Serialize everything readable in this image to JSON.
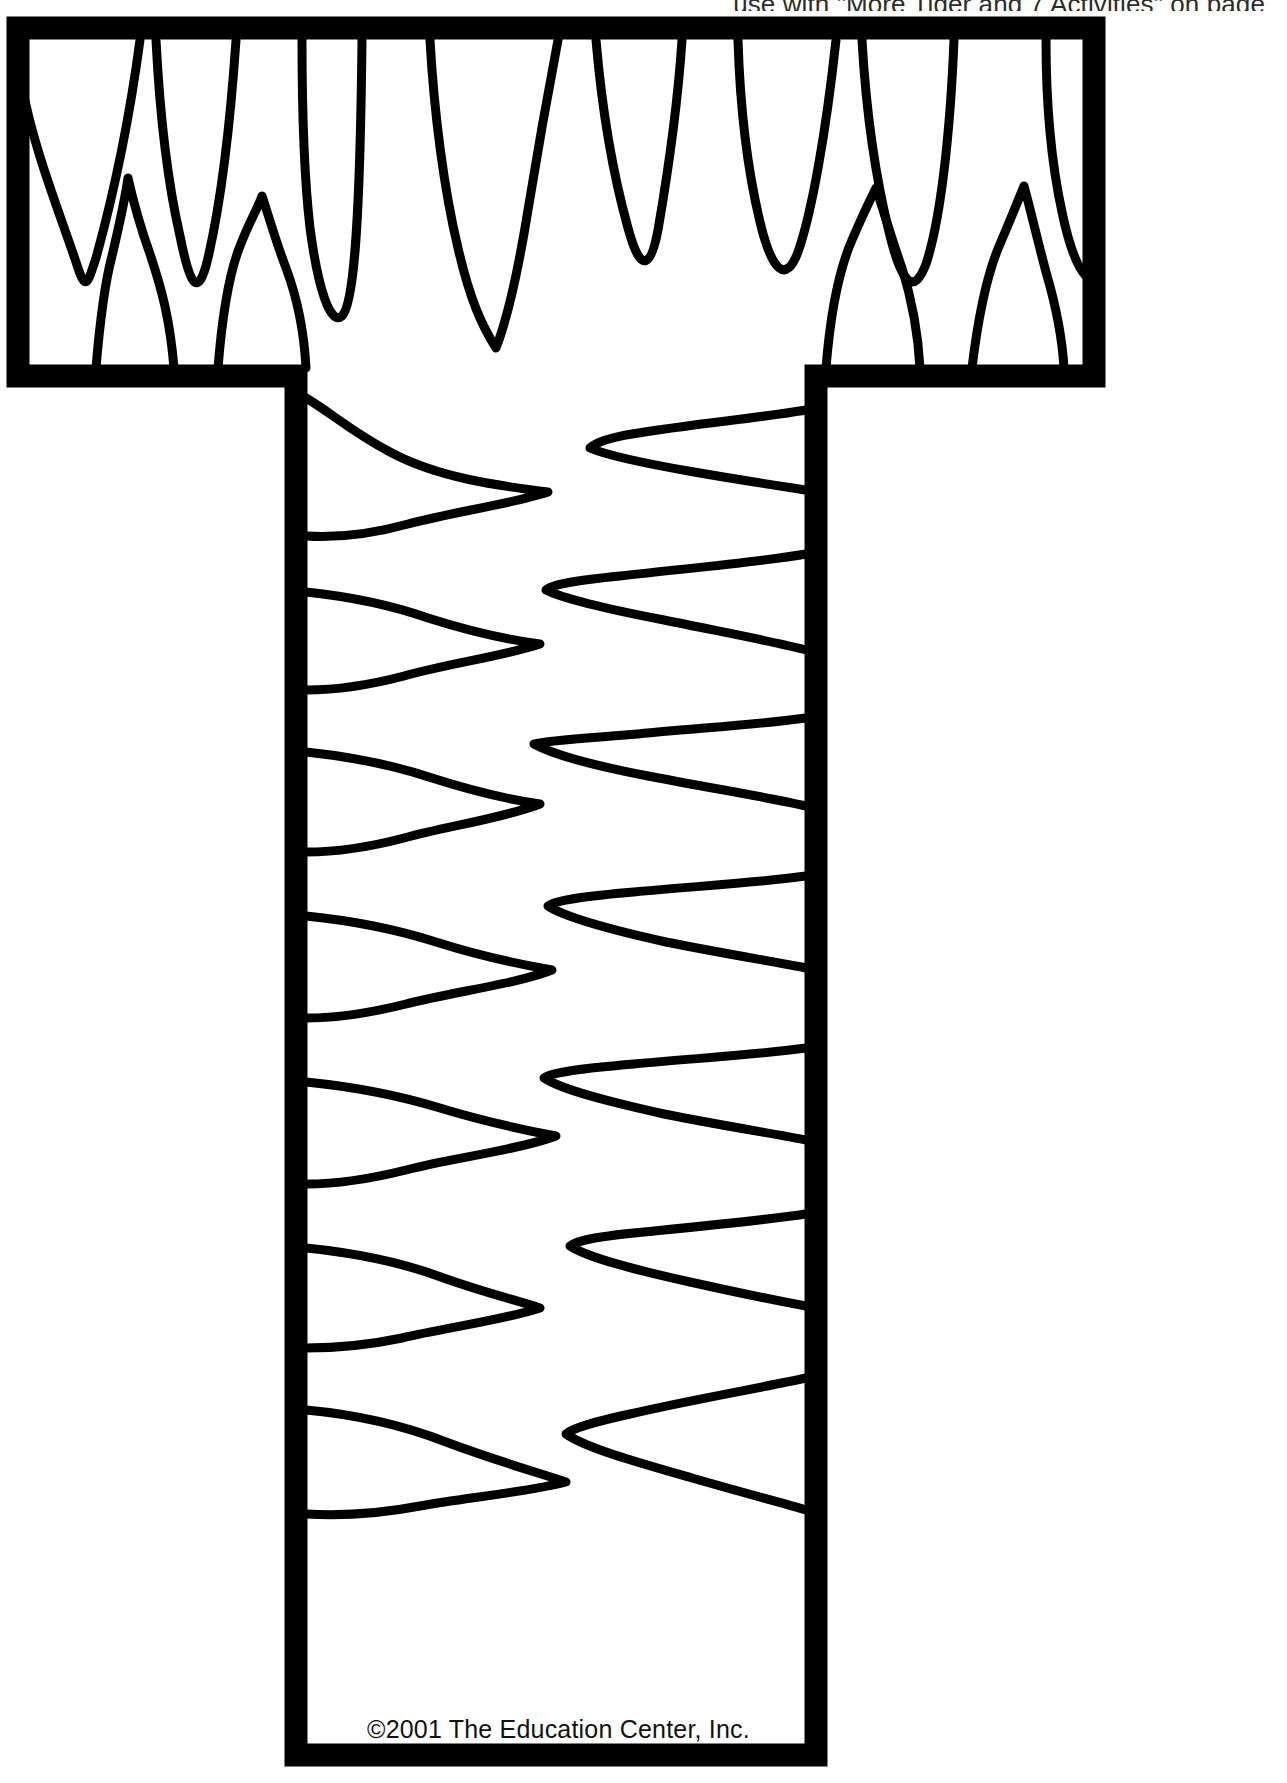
{
  "page": {
    "background_color": "#ffffff",
    "ink_color": "#000000",
    "width": 1287,
    "height": 1783
  },
  "header": {
    "instruction_text": "use with \"More Tiger and 7 Activities\" on page",
    "clipped": true
  },
  "artwork": {
    "name": "letter-t-tiger-stripe-pattern",
    "letter": "T",
    "description": "Block capital letter T outlined with a thick black border and filled with hand-drawn tiger stripe shapes",
    "outline_stroke_width": 22,
    "stripe_stroke_width": 9,
    "crossbar": {
      "label": "crossbar",
      "x": 18,
      "y": 28,
      "width": 1076,
      "height": 348,
      "stripe_style": "vertical flame stripes"
    },
    "stem": {
      "label": "stem",
      "x": 296,
      "y": 376,
      "width": 520,
      "height": 1379,
      "stripe_style": "horizontal pointed wedge stripes alternating from left and right"
    }
  },
  "footer": {
    "copyright": "©2001 The Education Center, Inc."
  }
}
